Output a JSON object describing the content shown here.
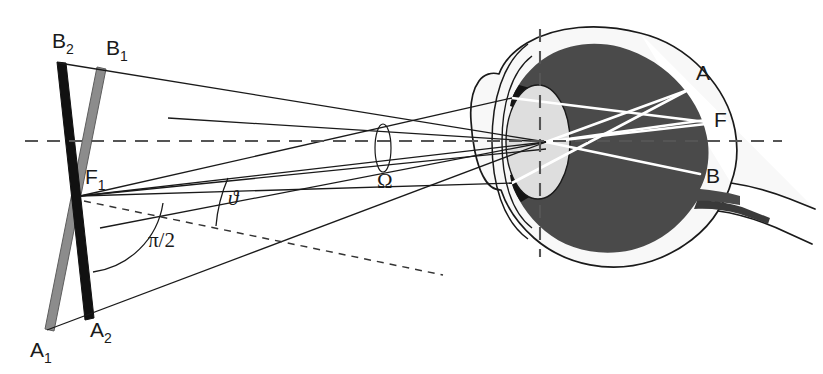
{
  "figure": {
    "background_color": "#ffffff",
    "stroke_color": "#1a1a1a",
    "bar_black_color": "#111111",
    "bar_gray_color": "#8c8c8c",
    "eye_interior_color": "#4a4a4a",
    "eye_lens_color": "#dcdcdc",
    "eye_white_color": "#f7f7f7",
    "ray_color": "#ffffff"
  },
  "labels": {
    "b2": {
      "text": "B",
      "sub": "2",
      "x": 52,
      "y": 48
    },
    "b1": {
      "text": "B",
      "sub": "1",
      "x": 106,
      "y": 55
    },
    "f1": {
      "text": "F",
      "sub": "1",
      "x": 85,
      "y": 184
    },
    "a1": {
      "text": "A",
      "sub": "1",
      "x": 30,
      "y": 357
    },
    "a2": {
      "text": "A",
      "sub": "2",
      "x": 90,
      "y": 337
    },
    "theta": {
      "text": "ϑ",
      "x": 228,
      "y": 205
    },
    "pi_over_two": {
      "text": "π/2",
      "x": 148,
      "y": 247
    },
    "omega": {
      "text": "Ω",
      "x": 390,
      "y": 188
    },
    "retina_a": {
      "text": "A",
      "x": 696,
      "y": 80
    },
    "retina_f": {
      "text": "F",
      "x": 714,
      "y": 127
    },
    "retina_b": {
      "text": "B",
      "x": 706,
      "y": 183
    }
  },
  "geometry": {
    "optical_axis_y": 141,
    "optical_axis_x_start": 25,
    "optical_axis_x_end": 782,
    "vertical_dashed_x": 540,
    "vertical_dashed_y_start": 29,
    "vertical_dashed_y_end": 257,
    "nodal_point": {
      "x": 546,
      "y": 142
    },
    "bar_black": {
      "top_x": 60,
      "top_y": 63,
      "bottom_x": 89,
      "bottom_y": 319,
      "width": 9
    },
    "bar_gray": {
      "top_x": 100,
      "top_y": 68,
      "bottom_x": 47,
      "bottom_y": 330,
      "width": 9
    },
    "crossing_point_f1": {
      "x": 80,
      "y": 196
    },
    "retina_point_a": {
      "x": 688,
      "y": 90
    },
    "retina_point_f": {
      "x": 706,
      "y": 122
    },
    "retina_point_b": {
      "x": 700,
      "y": 174
    }
  }
}
